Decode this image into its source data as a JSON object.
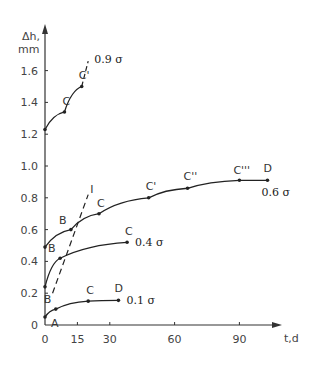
{
  "chart_data": {
    "type": "line",
    "title": "",
    "xlabel": "t,d",
    "ylabel": "Δh, mm",
    "xlim": [
      0,
      105
    ],
    "ylim": [
      0,
      1.8
    ],
    "xticks": [
      0,
      15,
      30,
      60,
      90
    ],
    "yticks": [
      0,
      0.2,
      0.4,
      0.6,
      0.8,
      1.0,
      1.2,
      1.4,
      1.6
    ],
    "ytick_labels": [
      "0",
      "0.2",
      "0.4",
      "0.6",
      "0.8",
      "1.0",
      "1.2",
      "1.4",
      "1.6"
    ],
    "grid": false,
    "series": [
      {
        "name": "0.1 σ",
        "label": "0.1 σ",
        "points": [
          {
            "t": 0,
            "dh": 0.05,
            "label": "A"
          },
          {
            "t": 5,
            "dh": 0.1,
            "label": "B"
          },
          {
            "t": 20,
            "dh": 0.15,
            "label": "C"
          },
          {
            "t": 34,
            "dh": 0.155,
            "label": "D"
          }
        ]
      },
      {
        "name": "0.4 σ",
        "label": "0.4 σ",
        "points": [
          {
            "t": 0,
            "dh": 0.24,
            "label": ""
          },
          {
            "t": 7,
            "dh": 0.42,
            "label": "B"
          },
          {
            "t": 38,
            "dh": 0.52,
            "label": "C"
          }
        ]
      },
      {
        "name": "0.6 σ",
        "label": "0.6 σ",
        "points": [
          {
            "t": 0,
            "dh": 0.49,
            "label": ""
          },
          {
            "t": 12,
            "dh": 0.6,
            "label": "B"
          },
          {
            "t": 25,
            "dh": 0.7,
            "label": "C"
          },
          {
            "t": 48,
            "dh": 0.8,
            "label": "C'"
          },
          {
            "t": 66,
            "dh": 0.86,
            "label": "C''"
          },
          {
            "t": 90,
            "dh": 0.91,
            "label": "C'''"
          },
          {
            "t": 103,
            "dh": 0.91,
            "label": "D"
          }
        ]
      },
      {
        "name": "0.9 σ",
        "label": "0.9 σ",
        "points": [
          {
            "t": 0,
            "dh": 1.23,
            "label": ""
          },
          {
            "t": 9,
            "dh": 1.34,
            "label": "C"
          },
          {
            "t": 17,
            "dh": 1.5,
            "label": "C'"
          }
        ],
        "dashed_extension": [
          {
            "t": 17,
            "dh": 1.5
          },
          {
            "t": 20,
            "dh": 1.66
          }
        ]
      }
    ],
    "annotations": [
      {
        "type": "dashed-line",
        "label": "I",
        "from": {
          "t": 3.5,
          "dh": 0.2
        },
        "to": {
          "t": 20,
          "dh": 0.82
        }
      },
      {
        "type": "text",
        "text": "A",
        "near": {
          "t": 0,
          "dh": 0.05
        }
      }
    ]
  }
}
